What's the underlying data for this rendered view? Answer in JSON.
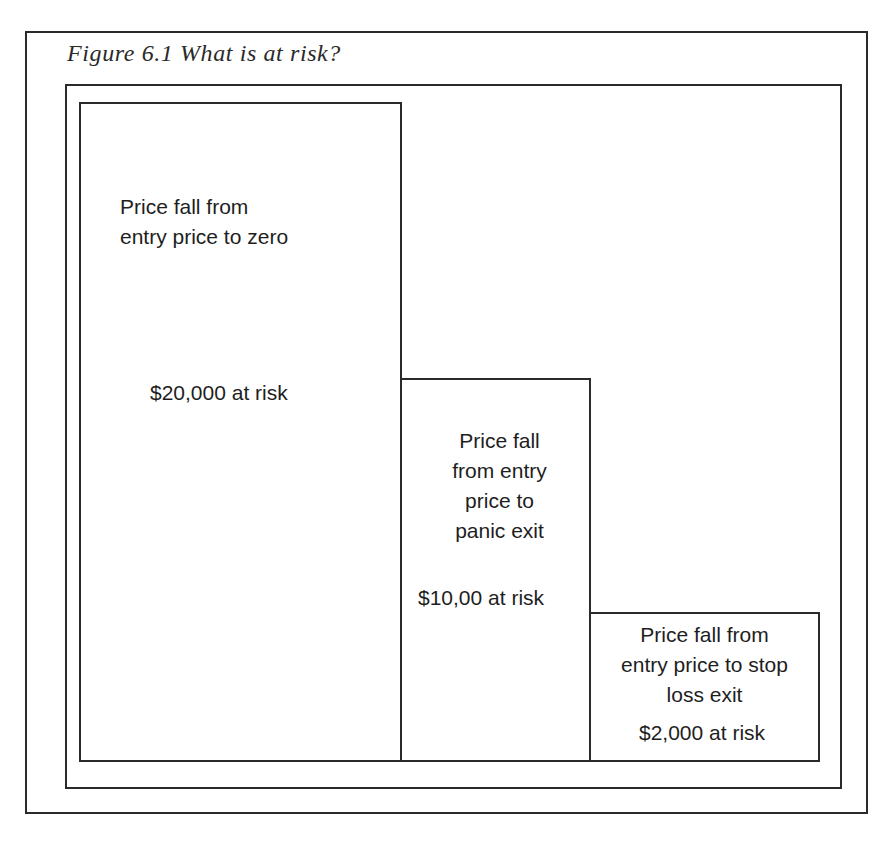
{
  "figure": {
    "caption": "Figure 6.1 What is at risk?"
  },
  "boxes": [
    {
      "id": "zero",
      "description_lines": [
        "Price fall from",
        "entry price to zero"
      ],
      "amount_label": "$20,000 at risk"
    },
    {
      "id": "panic",
      "description_lines": [
        "Price fall",
        "from entry",
        "price to",
        "panic exit"
      ],
      "amount_label": "$10,00 at risk"
    },
    {
      "id": "stop",
      "description_lines": [
        "Price fall from",
        "entry price to stop",
        "loss exit"
      ],
      "amount_label": "$2,000 at risk"
    }
  ],
  "colors": {
    "line": "#2a2a2a",
    "text": "#1e1e1e",
    "background": "#ffffff"
  }
}
